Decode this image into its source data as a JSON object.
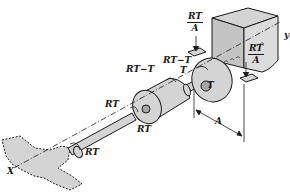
{
  "figure": {
    "colors": {
      "fill": "#d4d4d4",
      "stroke": "#1a1a1a",
      "background": "#ffffff"
    },
    "labels": {
      "motor_top_reaction": {
        "num": "RT",
        "den": "A"
      },
      "motor_side_reaction": {
        "num": "RT",
        "den": "A"
      },
      "motor_input_torque": "RT−T",
      "reducer_output_torque": "RT−T",
      "reducer_T_upper": "T",
      "reducer_T_lower": "T",
      "shaft_torque_upper": "RT",
      "shaft_torque_lower": "RT",
      "axis_x": "X",
      "axis_y": "y",
      "dimension": "A"
    }
  }
}
